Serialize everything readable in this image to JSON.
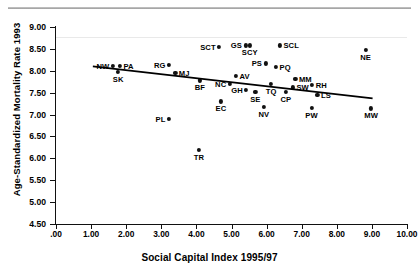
{
  "chart_data": {
    "type": "scatter",
    "title": "",
    "xlabel": "Social Capital Index 1995/97",
    "ylabel": "Age-Standardized Mortality Rate 1993",
    "xlim": [
      0.0,
      10.0
    ],
    "ylim": [
      4.5,
      9.0
    ],
    "xticks": [
      ".00",
      "1.00",
      "2.00",
      "3.00",
      "4.00",
      "5.00",
      "6.00",
      "7.00",
      "8.00",
      "9.00",
      "10.00"
    ],
    "yticks": [
      "4.50",
      "5.00",
      "5.50",
      "6.00",
      "6.50",
      "7.00",
      "7.50",
      "8.00",
      "8.50",
      "9.00"
    ],
    "grid": false,
    "legend": false,
    "point_color": "#111111",
    "trendline": {
      "visible": true,
      "color": "#000000",
      "x_start": 1.05,
      "x_end": 9.02,
      "y_start": 8.1,
      "y_end": 7.37
    },
    "points": [
      {
        "label": "NW",
        "x": 1.62,
        "y": 8.12,
        "label_pos": "left"
      },
      {
        "label": "PA",
        "x": 1.82,
        "y": 8.12,
        "label_pos": "right"
      },
      {
        "label": "SK",
        "x": 1.77,
        "y": 7.98,
        "label_pos": "below"
      },
      {
        "label": "RG",
        "x": 3.22,
        "y": 8.14,
        "label_pos": "left"
      },
      {
        "label": "MJ",
        "x": 3.4,
        "y": 7.96,
        "label_pos": "right"
      },
      {
        "label": "BF",
        "x": 4.1,
        "y": 7.78,
        "label_pos": "below"
      },
      {
        "label": "SCT",
        "x": 4.65,
        "y": 8.55,
        "label_pos": "left"
      },
      {
        "label": "GS",
        "x": 5.4,
        "y": 8.58,
        "label_pos": "left"
      },
      {
        "label": "SCY",
        "x": 5.52,
        "y": 8.58,
        "label_pos": "below"
      },
      {
        "label": "SCL",
        "x": 6.38,
        "y": 8.58,
        "label_pos": "right"
      },
      {
        "label": "PS",
        "x": 5.97,
        "y": 8.17,
        "label_pos": "left"
      },
      {
        "label": "PQ",
        "x": 6.27,
        "y": 8.08,
        "label_pos": "right"
      },
      {
        "label": "AV",
        "x": 5.13,
        "y": 7.88,
        "label_pos": "right"
      },
      {
        "label": "NC",
        "x": 4.95,
        "y": 7.7,
        "label_pos": "left"
      },
      {
        "label": "GH",
        "x": 5.42,
        "y": 7.57,
        "label_pos": "left"
      },
      {
        "label": "SE",
        "x": 5.68,
        "y": 7.52,
        "label_pos": "below"
      },
      {
        "label": "TQ",
        "x": 6.13,
        "y": 7.7,
        "label_pos": "below"
      },
      {
        "label": "CP",
        "x": 6.55,
        "y": 7.52,
        "label_pos": "below"
      },
      {
        "label": "SW",
        "x": 6.75,
        "y": 7.62,
        "label_pos": "right"
      },
      {
        "label": "MM",
        "x": 6.82,
        "y": 7.82,
        "label_pos": "right"
      },
      {
        "label": "RH",
        "x": 7.3,
        "y": 7.68,
        "label_pos": "right"
      },
      {
        "label": "LS",
        "x": 7.45,
        "y": 7.44,
        "label_pos": "right"
      },
      {
        "label": "NV",
        "x": 5.92,
        "y": 7.18,
        "label_pos": "below"
      },
      {
        "label": "PW",
        "x": 7.28,
        "y": 7.16,
        "label_pos": "below"
      },
      {
        "label": "MW",
        "x": 8.98,
        "y": 7.14,
        "label_pos": "below"
      },
      {
        "label": "NE",
        "x": 8.82,
        "y": 8.48,
        "label_pos": "below"
      },
      {
        "label": "EC",
        "x": 4.7,
        "y": 7.3,
        "label_pos": "below"
      },
      {
        "label": "PL",
        "x": 3.22,
        "y": 6.9,
        "label_pos": "left"
      },
      {
        "label": "TR",
        "x": 4.07,
        "y": 6.2,
        "label_pos": "below"
      }
    ]
  }
}
